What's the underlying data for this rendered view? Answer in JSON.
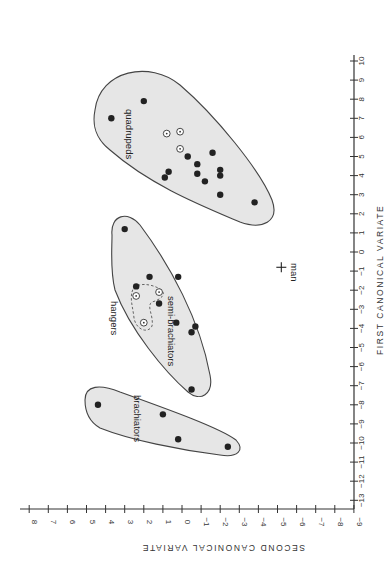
{
  "chart_data": {
    "type": "scatter",
    "orientation": "rotated 90 degrees (x-axis drawn vertically on right, y-axis drawn horizontally along bottom)",
    "title": "",
    "xlabel": "FIRST CANONICAL VARIATE",
    "ylabel": "SECOND CANONICAL VARIATE",
    "xlim": [
      -13,
      10
    ],
    "ylim": [
      -9,
      8
    ],
    "x_ticks": [
      -13,
      -12,
      -11,
      -10,
      -9,
      -8,
      -7,
      -6,
      -5,
      -4,
      -3,
      -2,
      -1,
      0,
      1,
      2,
      3,
      4,
      5,
      6,
      7,
      8,
      9,
      10
    ],
    "y_ticks": [
      8,
      7,
      6,
      5,
      4,
      3,
      2,
      1,
      0,
      -1,
      -2,
      -3,
      -4,
      -5,
      -6,
      -7,
      -8,
      -9
    ],
    "grid": false,
    "series": [
      {
        "name": "brachiators",
        "marker": "filled",
        "points": [
          {
            "x": -8.0,
            "y": 4.4
          },
          {
            "x": -8.5,
            "y": 1.0
          },
          {
            "x": -9.8,
            "y": 0.2
          },
          {
            "x": -10.2,
            "y": -2.4
          }
        ]
      },
      {
        "name": "semi-brachiators",
        "marker": "filled",
        "points": [
          {
            "x": 1.2,
            "y": 3.0
          },
          {
            "x": -1.3,
            "y": 1.7
          },
          {
            "x": -1.3,
            "y": 0.2
          },
          {
            "x": -1.8,
            "y": 2.4
          },
          {
            "x": -2.7,
            "y": 1.2
          },
          {
            "x": -3.7,
            "y": 0.3
          },
          {
            "x": -3.9,
            "y": -0.7
          },
          {
            "x": -4.2,
            "y": -0.5
          },
          {
            "x": -7.2,
            "y": -0.5
          }
        ]
      },
      {
        "name": "hangers",
        "marker": "open",
        "points": [
          {
            "x": -2.3,
            "y": 2.4
          },
          {
            "x": -2.1,
            "y": 1.2
          },
          {
            "x": -3.7,
            "y": 2.0
          }
        ]
      },
      {
        "name": "quadrupeds",
        "marker": "filled",
        "points": [
          {
            "x": 7.9,
            "y": 2.0
          },
          {
            "x": 7.0,
            "y": 3.7
          },
          {
            "x": 5.2,
            "y": -1.6
          },
          {
            "x": 5.0,
            "y": -0.3
          },
          {
            "x": 4.6,
            "y": -0.8
          },
          {
            "x": 4.1,
            "y": -0.8
          },
          {
            "x": 4.2,
            "y": 0.7
          },
          {
            "x": 3.9,
            "y": 0.9
          },
          {
            "x": 3.7,
            "y": -1.2
          },
          {
            "x": 4.3,
            "y": -2.0
          },
          {
            "x": 4.0,
            "y": -2.0
          },
          {
            "x": 3.0,
            "y": -2.0
          },
          {
            "x": 2.6,
            "y": -3.8
          }
        ]
      },
      {
        "name": "quadrupeds (open)",
        "marker": "open",
        "points": [
          {
            "x": 6.2,
            "y": 0.8
          },
          {
            "x": 6.3,
            "y": 0.1
          },
          {
            "x": 5.4,
            "y": 0.1
          }
        ]
      },
      {
        "name": "man",
        "marker": "plus",
        "points": [
          {
            "x": -0.8,
            "y": -5.2
          }
        ]
      }
    ],
    "annotations": [
      "brachiators",
      "semi-brachiators",
      "hangers",
      "quadrupeds",
      "man"
    ]
  },
  "labels": {
    "x_axis_title": "FIRST CANONICAL VARIATE",
    "y_axis_title": "SECOND CANONICAL VARIATE",
    "brachiators": "brachiators",
    "semi_brachiators": "semi-brachiators",
    "hangers": "hangers",
    "quadrupeds": "quadrupeds",
    "man": "man"
  }
}
